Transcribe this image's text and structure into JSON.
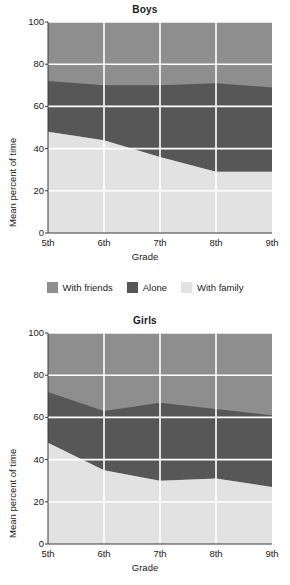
{
  "legend": {
    "items": [
      {
        "label": "With friends",
        "color": "#8e8e8e",
        "key": "with_friends"
      },
      {
        "label": "Alone",
        "color": "#575757",
        "key": "alone"
      },
      {
        "label": "With family",
        "color": "#e2e2e2",
        "key": "with_family"
      }
    ]
  },
  "panels": {
    "boys": {
      "title": "Boys",
      "xlabel": "Grade",
      "ylabel": "Mean percent of time"
    },
    "girls": {
      "title": "Girls",
      "xlabel": "Grade",
      "ylabel": "Mean percent of time"
    }
  },
  "chart_data": [
    {
      "type": "area",
      "title": "Boys",
      "xlabel": "Grade",
      "ylabel": "Mean percent of time",
      "categories": [
        "5th",
        "6th",
        "7th",
        "8th",
        "9th"
      ],
      "xtick_labels": [
        "5th",
        "6th",
        "7th",
        "8th",
        "9th"
      ],
      "ytick_labels": [
        "0",
        "20",
        "40",
        "60",
        "80",
        "100"
      ],
      "yticks": [
        0,
        20,
        40,
        60,
        80,
        100
      ],
      "ylim": [
        0,
        100
      ],
      "grid": true,
      "stacked": true,
      "legend_position": "between-panels",
      "series": [
        {
          "name": "With family",
          "color": "#e2e2e2",
          "values": [
            48,
            44,
            36,
            29,
            29
          ]
        },
        {
          "name": "Alone",
          "color": "#575757",
          "values": [
            24,
            26,
            34,
            42,
            40
          ]
        },
        {
          "name": "With friends",
          "color": "#8e8e8e",
          "values": [
            28,
            30,
            30,
            29,
            31
          ]
        }
      ],
      "cumulative_boundaries": {
        "family_top": [
          48,
          44,
          36,
          29,
          29
        ],
        "alone_top": [
          72,
          70,
          70,
          71,
          69
        ]
      }
    },
    {
      "type": "area",
      "title": "Girls",
      "xlabel": "Grade",
      "ylabel": "Mean percent of time",
      "categories": [
        "5th",
        "6th",
        "7th",
        "8th",
        "9th"
      ],
      "xtick_labels": [
        "5th",
        "6th",
        "7th",
        "8th",
        "9th"
      ],
      "ytick_labels": [
        "0",
        "20",
        "40",
        "60",
        "80",
        "100"
      ],
      "yticks": [
        0,
        20,
        40,
        60,
        80,
        100
      ],
      "ylim": [
        0,
        100
      ],
      "grid": true,
      "stacked": true,
      "legend_position": "between-panels",
      "series": [
        {
          "name": "With family",
          "color": "#e2e2e2",
          "values": [
            48,
            35,
            30,
            31,
            27
          ]
        },
        {
          "name": "Alone",
          "color": "#575757",
          "values": [
            24,
            28,
            37,
            33,
            34
          ]
        },
        {
          "name": "With friends",
          "color": "#8e8e8e",
          "values": [
            28,
            37,
            33,
            36,
            39
          ]
        }
      ],
      "cumulative_boundaries": {
        "family_top": [
          48,
          35,
          30,
          31,
          27
        ],
        "alone_top": [
          72,
          63,
          67,
          64,
          61
        ]
      }
    }
  ]
}
